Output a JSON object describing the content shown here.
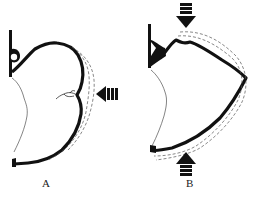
{
  "panels": [
    {
      "label": "A",
      "arrow_direction": "left",
      "arrow_position": "right-middle"
    },
    {
      "label": "B",
      "arrow_direction": "vertical",
      "arrow_positions": [
        "top",
        "bottom"
      ]
    }
  ],
  "colors": {
    "outline": "#111111",
    "dashed": "#555555",
    "background": "#ffffff"
  }
}
